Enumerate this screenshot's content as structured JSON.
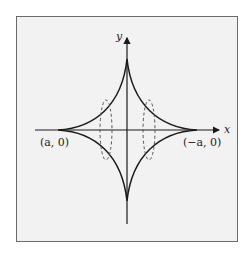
{
  "figure": {
    "type": "astroid curve with dashed cross-section ellipses",
    "axes": {
      "x_label": "x",
      "y_label": "y"
    },
    "points": {
      "left_cusp": "(a, 0)",
      "right_cusp": "(−a, 0)"
    },
    "colors": {
      "curve": "#1a1a1a",
      "axes": "#1a1a1a",
      "dashed": "#555555",
      "background": "#f2f2f2",
      "frame": "#6a6a6a"
    }
  }
}
